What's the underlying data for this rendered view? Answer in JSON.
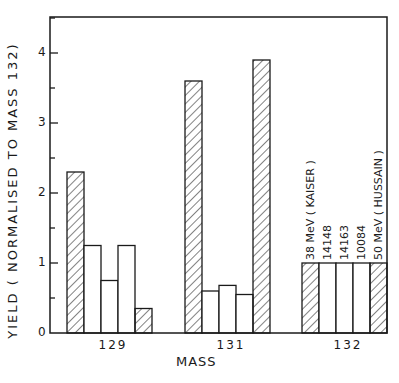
{
  "chart_data": {
    "type": "bar",
    "title": "",
    "xlabel": "MASS",
    "ylabel": "YIELD ( NORMALISED TO MASS 132)",
    "ylim": [
      0,
      4.5
    ],
    "yticks": [
      0,
      1,
      2,
      3,
      4
    ],
    "grid": false,
    "legend": "none (series identified by rotated labels above mass 132 bars)",
    "categories": [
      "129",
      "131",
      "132"
    ],
    "series": [
      {
        "name": "38 MeV (KAISER)",
        "pattern": "hatched",
        "values": [
          2.3,
          3.6,
          1.0
        ]
      },
      {
        "name": "14148",
        "pattern": "open",
        "values": [
          1.25,
          0.6,
          1.0
        ]
      },
      {
        "name": "14163",
        "pattern": "open",
        "values": [
          0.75,
          0.68,
          1.0
        ]
      },
      {
        "name": "10084",
        "pattern": "open",
        "values": [
          1.25,
          0.55,
          1.0
        ]
      },
      {
        "name": "50 MeV (HUSSAIN)",
        "pattern": "hatched",
        "values": [
          0.35,
          3.9,
          1.0
        ]
      }
    ]
  },
  "labels": {
    "ylabel": "YIELD ( NORMALISED TO MASS 132)",
    "xlabel": "MASS",
    "yticks": [
      "0",
      "1",
      "2",
      "3",
      "4"
    ],
    "xticks": [
      "129",
      "131",
      "132"
    ],
    "bar_labels": [
      "38 MeV ( KAISER )",
      "14148",
      "14163",
      "10084",
      "50 MeV ( HUSSAIN )"
    ]
  },
  "colors": {
    "ink": "#1a1a1a",
    "background": "#ffffff"
  }
}
